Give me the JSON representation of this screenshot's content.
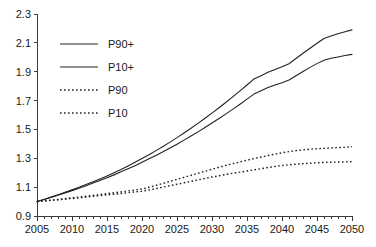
{
  "chart_data": {
    "type": "line",
    "title": "",
    "subtitle": "",
    "xlabel": "",
    "ylabel": "",
    "xlim": [
      2005,
      2050
    ],
    "ylim": [
      0.9,
      2.3
    ],
    "grid": false,
    "legend_position": "top-left",
    "x_tick_labels": [
      "2005",
      "2010",
      "2015",
      "2020",
      "2025",
      "2030",
      "2035",
      "2040",
      "2045",
      "2050"
    ],
    "x_tick_values": [
      2005,
      2010,
      2015,
      2020,
      2025,
      2030,
      2035,
      2040,
      2045,
      2050
    ],
    "x_minor_tick_step": 1,
    "y_tick_labels": [
      "0.9",
      "1.1",
      "1.3",
      "1.5",
      "1.7",
      "1.9",
      "2.1",
      "2.3"
    ],
    "y_tick_values": [
      0.9,
      1.1,
      1.3,
      1.5,
      1.7,
      1.9,
      2.1,
      2.3
    ],
    "x": [
      2005,
      2006,
      2007,
      2008,
      2009,
      2010,
      2011,
      2012,
      2013,
      2014,
      2015,
      2016,
      2017,
      2018,
      2019,
      2020,
      2021,
      2022,
      2023,
      2024,
      2025,
      2026,
      2027,
      2028,
      2029,
      2030,
      2031,
      2032,
      2033,
      2034,
      2035,
      2036,
      2037,
      2038,
      2039,
      2040,
      2041,
      2042,
      2043,
      2044,
      2045,
      2046,
      2047,
      2048,
      2049,
      2050
    ],
    "series": [
      {
        "name": "P90+",
        "style": "solid",
        "color": "#222222",
        "values": [
          1.0,
          1.015,
          1.031,
          1.047,
          1.064,
          1.081,
          1.099,
          1.118,
          1.137,
          1.157,
          1.178,
          1.2,
          1.223,
          1.247,
          1.272,
          1.298,
          1.325,
          1.353,
          1.382,
          1.412,
          1.443,
          1.475,
          1.508,
          1.542,
          1.577,
          1.613,
          1.65,
          1.688,
          1.727,
          1.767,
          1.808,
          1.85,
          1.872,
          1.896,
          1.916,
          1.934,
          1.955,
          1.992,
          2.028,
          2.063,
          2.097,
          2.13,
          2.148,
          2.163,
          2.177,
          2.19
        ]
      },
      {
        "name": "P10+",
        "style": "solid",
        "color": "#222222",
        "values": [
          1.0,
          1.014,
          1.029,
          1.044,
          1.06,
          1.076,
          1.093,
          1.11,
          1.128,
          1.146,
          1.165,
          1.185,
          1.206,
          1.227,
          1.249,
          1.272,
          1.296,
          1.32,
          1.345,
          1.371,
          1.398,
          1.426,
          1.454,
          1.483,
          1.513,
          1.544,
          1.576,
          1.608,
          1.641,
          1.675,
          1.71,
          1.745,
          1.768,
          1.79,
          1.808,
          1.824,
          1.842,
          1.872,
          1.902,
          1.93,
          1.956,
          1.98,
          1.993,
          2.002,
          2.012,
          2.02
        ]
      },
      {
        "name": "P90",
        "style": "dotted",
        "color": "#222222",
        "values": [
          1.0,
          1.005,
          1.01,
          1.015,
          1.02,
          1.026,
          1.031,
          1.037,
          1.043,
          1.049,
          1.055,
          1.061,
          1.067,
          1.074,
          1.08,
          1.087,
          1.099,
          1.112,
          1.126,
          1.14,
          1.154,
          1.168,
          1.182,
          1.196,
          1.21,
          1.224,
          1.238,
          1.251,
          1.263,
          1.275,
          1.287,
          1.298,
          1.309,
          1.319,
          1.329,
          1.338,
          1.346,
          1.353,
          1.358,
          1.363,
          1.366,
          1.369,
          1.372,
          1.374,
          1.376,
          1.38
        ]
      },
      {
        "name": "P10",
        "style": "dotted",
        "color": "#222222",
        "values": [
          1.0,
          1.004,
          1.008,
          1.012,
          1.017,
          1.021,
          1.026,
          1.031,
          1.036,
          1.041,
          1.046,
          1.051,
          1.056,
          1.062,
          1.067,
          1.072,
          1.08,
          1.09,
          1.1,
          1.11,
          1.12,
          1.13,
          1.14,
          1.15,
          1.16,
          1.17,
          1.179,
          1.188,
          1.196,
          1.204,
          1.212,
          1.22,
          1.228,
          1.236,
          1.243,
          1.25,
          1.255,
          1.259,
          1.263,
          1.266,
          1.269,
          1.271,
          1.273,
          1.274,
          1.275,
          1.277
        ]
      }
    ],
    "legend": [
      {
        "label": "P90+",
        "style": "solid"
      },
      {
        "label": "P10+",
        "style": "solid"
      },
      {
        "label": "P90",
        "style": "dotted"
      },
      {
        "label": "P10",
        "style": "dotted"
      }
    ]
  },
  "colors": {
    "line": "#222222",
    "axis": "#3a3a3a",
    "text": "#1a1a1a",
    "background": "#ffffff"
  }
}
